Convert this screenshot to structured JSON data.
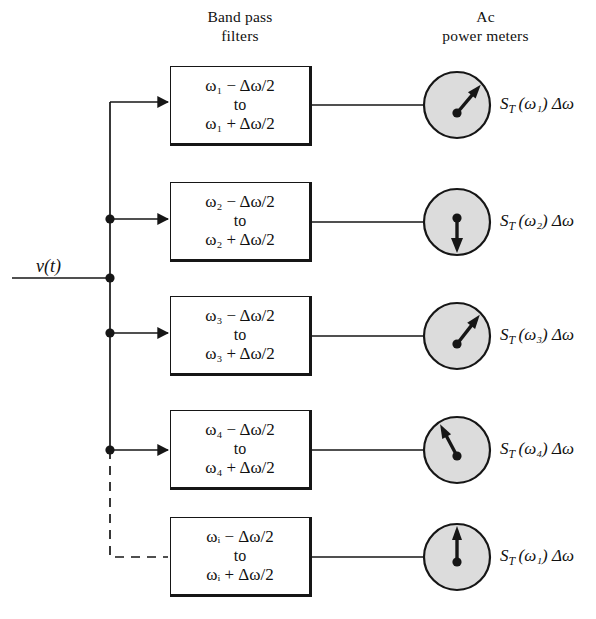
{
  "figure": {
    "title_absent": true,
    "background_color": "#ffffff",
    "ink_color": "#111111",
    "meter_face_color": "#dcdcdc"
  },
  "headers": {
    "filters": "Band pass\nfilters",
    "meters": "Ac\npower meters"
  },
  "input": {
    "label": "v(t)"
  },
  "bus": {
    "note": "vertical distribution bus, solid for taps 1-4, dashed continuation to tap 5",
    "dashed_tail": true,
    "junction_dots": [
      2,
      3,
      4,
      5
    ]
  },
  "channels": [
    {
      "index": 1,
      "omega": "ω",
      "subscript": "1",
      "filter_low": "ω₁ − Δω/2",
      "filter_mid": "to",
      "filter_high": "ω₁ + Δω/2",
      "meter_label": "S_T(ω₁) Δω",
      "needle_angle_deg": 40,
      "needle_direction": "up-right",
      "tap_dot": false,
      "dashed_feed": false
    },
    {
      "index": 2,
      "omega": "ω",
      "subscript": "2",
      "filter_low": "ω₂ − Δω/2",
      "filter_mid": "to",
      "filter_high": "ω₂ + Δω/2",
      "meter_label": "S_T(ω₂) Δω",
      "needle_angle_deg": 180,
      "needle_direction": "down",
      "tap_dot": true,
      "dashed_feed": false
    },
    {
      "index": 3,
      "omega": "ω",
      "subscript": "3",
      "filter_low": "ω₃ − Δω/2",
      "filter_mid": "to",
      "filter_high": "ω₃ + Δω/2",
      "meter_label": "S_T(ω₃) Δω",
      "needle_angle_deg": 38,
      "needle_direction": "up-right",
      "tap_dot": true,
      "dashed_feed": false
    },
    {
      "index": 4,
      "omega": "ω",
      "subscript": "4",
      "filter_low": "ω₄ − Δω/2",
      "filter_mid": "to",
      "filter_high": "ω₄ + Δω/2",
      "meter_label": "S_T(ω₄) Δω",
      "needle_angle_deg": -28,
      "needle_direction": "up-left",
      "tap_dot": true,
      "dashed_feed": false
    },
    {
      "index": 5,
      "omega": "ω",
      "subscript": "i",
      "filter_low": "ωᵢ − Δω/2",
      "filter_mid": "to",
      "filter_high": "ωᵢ + Δω/2",
      "meter_label": "S_T(ω₁) Δω",
      "needle_angle_deg": 0,
      "needle_direction": "up",
      "tap_dot": true,
      "dashed_feed": true
    }
  ]
}
